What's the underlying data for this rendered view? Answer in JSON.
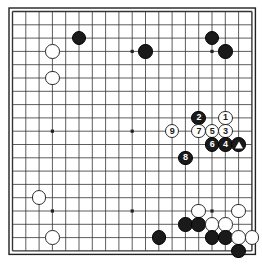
{
  "board": {
    "kind": "go-board-diagram",
    "size": 19,
    "line_color": "#333333",
    "border_color": "#222222",
    "background_color": "#ffffff",
    "black_color": "#1a1a1a",
    "white_color": "#ffffff",
    "geometry": {
      "left": 12.5,
      "top": 11.5,
      "spacing": 13.3,
      "stone_diameter": 14.5
    },
    "star_points": [
      {
        "col": 3,
        "row": 3
      },
      {
        "col": 9,
        "row": 3
      },
      {
        "col": 15,
        "row": 3
      },
      {
        "col": 3,
        "row": 9
      },
      {
        "col": 9,
        "row": 9
      },
      {
        "col": 15,
        "row": 9
      },
      {
        "col": 3,
        "row": 15
      },
      {
        "col": 9,
        "row": 15
      },
      {
        "col": 15,
        "row": 15
      }
    ],
    "stones": [
      {
        "col": 5,
        "row": 2,
        "color": "black",
        "label": ""
      },
      {
        "col": 3,
        "row": 3,
        "color": "white",
        "label": ""
      },
      {
        "col": 3,
        "row": 5,
        "color": "white",
        "label": ""
      },
      {
        "col": 10,
        "row": 3,
        "color": "black",
        "label": ""
      },
      {
        "col": 15,
        "row": 2,
        "color": "black",
        "label": ""
      },
      {
        "col": 16,
        "row": 3,
        "color": "black",
        "label": ""
      },
      {
        "col": 14,
        "row": 8,
        "color": "black",
        "label": "2"
      },
      {
        "col": 16,
        "row": 8,
        "color": "white",
        "label": "1"
      },
      {
        "col": 12,
        "row": 9,
        "color": "white",
        "label": "9"
      },
      {
        "col": 14,
        "row": 9,
        "color": "white",
        "label": "7"
      },
      {
        "col": 15,
        "row": 9,
        "color": "white",
        "label": "5"
      },
      {
        "col": 16,
        "row": 9,
        "color": "white",
        "label": "3"
      },
      {
        "col": 15,
        "row": 10,
        "color": "black",
        "label": "6"
      },
      {
        "col": 16,
        "row": 10,
        "color": "black",
        "label": "4"
      },
      {
        "col": 17,
        "row": 10,
        "color": "black",
        "label": "triangle"
      },
      {
        "col": 13,
        "row": 11,
        "color": "black",
        "label": "8"
      },
      {
        "col": 2,
        "row": 14,
        "color": "white",
        "label": ""
      },
      {
        "col": 3,
        "row": 17,
        "color": "white",
        "label": ""
      },
      {
        "col": 14,
        "row": 15,
        "color": "white",
        "label": ""
      },
      {
        "col": 17,
        "row": 15,
        "color": "white",
        "label": ""
      },
      {
        "col": 13,
        "row": 16,
        "color": "black",
        "label": ""
      },
      {
        "col": 14,
        "row": 16,
        "color": "black",
        "label": ""
      },
      {
        "col": 15,
        "row": 16,
        "color": "white",
        "label": ""
      },
      {
        "col": 16,
        "row": 16,
        "color": "white",
        "label": ""
      },
      {
        "col": 11,
        "row": 17,
        "color": "black",
        "label": ""
      },
      {
        "col": 15,
        "row": 17,
        "color": "black",
        "label": ""
      },
      {
        "col": 16,
        "row": 17,
        "color": "black",
        "label": ""
      },
      {
        "col": 17,
        "row": 17,
        "color": "white",
        "label": ""
      },
      {
        "col": 18,
        "row": 17,
        "color": "white",
        "label": ""
      },
      {
        "col": 17,
        "row": 18,
        "color": "black",
        "label": ""
      }
    ]
  }
}
